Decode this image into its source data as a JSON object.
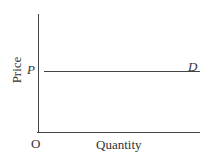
{
  "diagram": {
    "type": "perfectly elastic demand curve",
    "y_axis_label": "Price",
    "x_axis_label": "Quantity",
    "origin_label": "O",
    "price_level_label": "P",
    "curve_label": "D"
  },
  "chart_data": {
    "type": "line",
    "title": "",
    "xlabel": "Quantity",
    "ylabel": "Price",
    "series": [
      {
        "name": "D",
        "x": [
          0,
          1
        ],
        "y": [
          "P",
          "P"
        ]
      }
    ],
    "annotations": [
      "O",
      "P",
      "D"
    ],
    "grid": false
  }
}
